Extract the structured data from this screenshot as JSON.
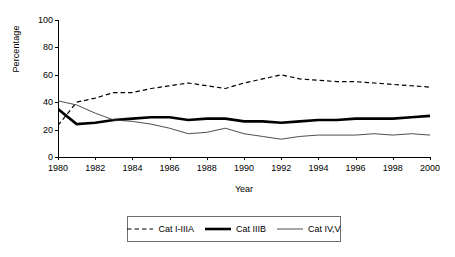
{
  "chart_data": {
    "type": "line",
    "title": "",
    "xlabel": "Year",
    "ylabel": "Percentage",
    "xlim": [
      1980,
      2000
    ],
    "ylim": [
      0,
      100
    ],
    "ytick_values": [
      0,
      20,
      40,
      60,
      80,
      100
    ],
    "ytick_labels": [
      "0",
      "20",
      "40",
      "60",
      "80",
      "100"
    ],
    "xtick_values": [
      1980,
      1982,
      1984,
      1986,
      1988,
      1990,
      1992,
      1994,
      1996,
      1998,
      2000
    ],
    "xtick_labels": [
      "1980",
      "1982",
      "1984",
      "1986",
      "1988",
      "1990",
      "1992",
      "1994",
      "1996",
      "1998",
      "2000"
    ],
    "grid": false,
    "legend_position": "bottom-center",
    "x": [
      1980,
      1981,
      1982,
      1983,
      1984,
      1985,
      1986,
      1987,
      1988,
      1989,
      1990,
      1991,
      1992,
      1993,
      1994,
      1995,
      1996,
      1997,
      1998,
      1999,
      2000
    ],
    "series": [
      {
        "name": "Cat I-IIIA",
        "style": "dashed",
        "color": "#000000",
        "width": 1.2,
        "values": [
          23,
          40,
          43,
          47,
          47,
          50,
          52,
          54,
          52,
          50,
          54,
          57,
          60,
          57,
          56,
          55,
          55,
          54,
          53,
          52,
          51
        ]
      },
      {
        "name": "Cat IIIB",
        "style": "solid-thick",
        "color": "#000000",
        "width": 2.6,
        "values": [
          35,
          24,
          25,
          27,
          28,
          29,
          29,
          27,
          28,
          28,
          26,
          26,
          25,
          26,
          27,
          27,
          28,
          28,
          28,
          29,
          30
        ]
      },
      {
        "name": "Cat IV,V",
        "style": "solid-thin",
        "color": "#3a3a3a",
        "width": 0.9,
        "values": [
          41,
          38,
          32,
          27,
          26,
          24,
          21,
          17,
          18,
          21,
          17,
          15,
          13,
          15,
          16,
          16,
          16,
          17,
          16,
          17,
          16
        ]
      }
    ]
  },
  "legend": {
    "items": [
      {
        "label": "Cat I-IIIA",
        "swatch": "dashed-line-swatch"
      },
      {
        "label": "Cat IIIB",
        "swatch": "thick-line-swatch"
      },
      {
        "label": "Cat IV,V",
        "swatch": "thin-line-swatch"
      }
    ]
  }
}
